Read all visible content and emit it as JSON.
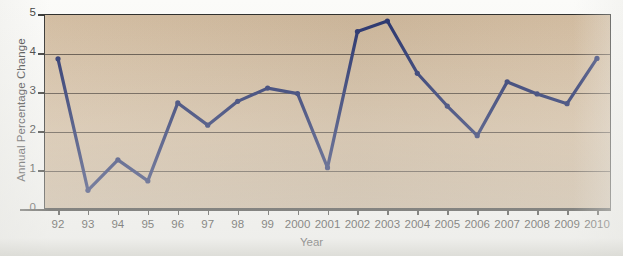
{
  "chart_data": {
    "type": "line",
    "title": "",
    "xlabel": "Year",
    "ylabel": "Annual Percentage Change",
    "categories": [
      "92",
      "93",
      "94",
      "95",
      "96",
      "97",
      "98",
      "99",
      "2000",
      "2001",
      "2002",
      "2003",
      "2004",
      "2005",
      "2006",
      "2007",
      "2008",
      "2009",
      "2010"
    ],
    "values": [
      3.85,
      0.48,
      1.26,
      0.72,
      2.72,
      2.15,
      2.76,
      3.1,
      2.96,
      1.06,
      4.55,
      4.82,
      3.48,
      2.64,
      1.88,
      3.26,
      2.95,
      2.7,
      3.86
    ],
    "series": [
      {
        "name": "Annual Percentage Change",
        "values": [
          3.85,
          0.48,
          1.26,
          0.72,
          2.72,
          2.15,
          2.76,
          3.1,
          2.96,
          1.06,
          4.55,
          4.82,
          3.48,
          2.64,
          1.88,
          3.26,
          2.95,
          2.7,
          3.86
        ]
      }
    ],
    "yticks": [
      0,
      1,
      2,
      3,
      4,
      5
    ],
    "ytick_labels": [
      "0",
      "1",
      "2",
      "3",
      "4",
      "5"
    ],
    "ylim": [
      0,
      5
    ],
    "grid": true,
    "legend": "none",
    "colors": {
      "line": "#24306b",
      "marker": "#24306b",
      "plot_background": "#d4bc9e",
      "gridline": "#4a4036",
      "axis": "#2a2a28",
      "text": "#1d1d1b",
      "page_background": "#fbfbf9"
    }
  }
}
